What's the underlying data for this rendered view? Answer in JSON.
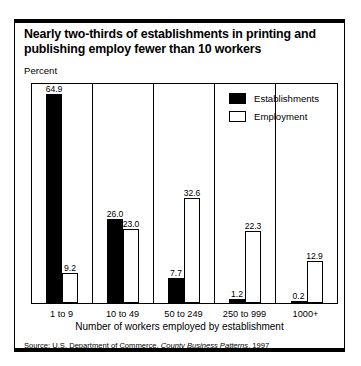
{
  "card": {
    "title_line1": "Nearly two-thirds of establishments in printing and",
    "title_line2": "publishing employ fewer than 10 workers",
    "percent_label": "Percent",
    "source_prefix": "Source: U.S. Department of Commerce, ",
    "source_italic": "County Business Patterns",
    "source_suffix": ", 1997"
  },
  "chart_data": {
    "type": "bar",
    "title": "Nearly two-thirds of establishments in printing and publishing employ fewer than 10 workers",
    "subtitle": "",
    "xlabel": "Number of workers employed by establishment",
    "ylabel": "Percent",
    "ylim": [
      0,
      68
    ],
    "grid": false,
    "legend_position": "top-right",
    "categories": [
      "1 to 9",
      "10 to 49",
      "50 to 249",
      "250 to 999",
      "1000+"
    ],
    "series": [
      {
        "name": "Establishments",
        "color": "#000000",
        "style": "filled",
        "values": [
          64.9,
          26.0,
          7.7,
          1.2,
          0.2
        ],
        "labels": [
          "64.9",
          "26.0",
          "7.7",
          "1.2",
          "0.2"
        ]
      },
      {
        "name": "Employment",
        "color": "#ffffff",
        "style": "outlined",
        "values": [
          9.2,
          23.0,
          32.6,
          22.3,
          12.9
        ],
        "labels": [
          "9.2",
          "23.0",
          "32.6",
          "22.3",
          "12.9"
        ]
      }
    ],
    "source": "Source: U.S. Department of Commerce, County Business Patterns, 1997"
  }
}
